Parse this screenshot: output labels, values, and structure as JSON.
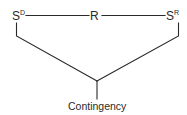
{
  "diagram": {
    "nodes": {
      "sd": {
        "base": "S",
        "superscript": "D"
      },
      "r": {
        "label": "R"
      },
      "sr": {
        "base": "S",
        "superscript": "R"
      }
    },
    "caption": "Contingency",
    "colors": {
      "line": "#2a2a2a",
      "text": "#2a2a2a",
      "background": "#ffffff"
    },
    "edges": [
      {
        "from": "S^D",
        "to": "R"
      },
      {
        "from": "R",
        "to": "S^R"
      },
      {
        "from": "S^D",
        "to": "junction"
      },
      {
        "from": "S^R",
        "to": "junction"
      },
      {
        "from": "junction",
        "to": "Contingency"
      }
    ]
  }
}
